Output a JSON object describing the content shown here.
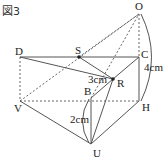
{
  "figure": {
    "title": "図3",
    "points": {
      "O": "O",
      "D": "D",
      "S": "S",
      "C": "C",
      "R": "R",
      "B": "B",
      "V": "V",
      "H": "H",
      "U": "U"
    },
    "measurements": {
      "OC": "4cm",
      "SR": "3cm",
      "BU": "2cm"
    }
  }
}
